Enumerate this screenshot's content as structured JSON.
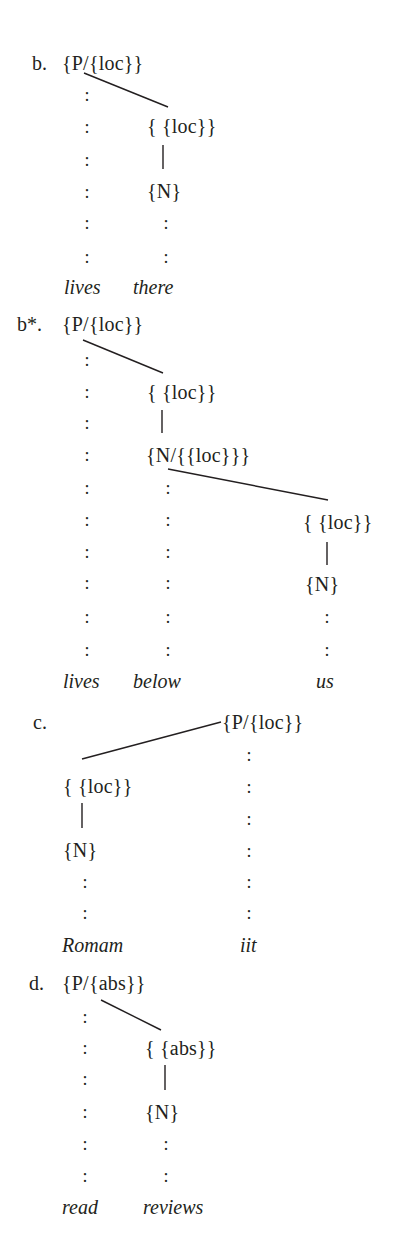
{
  "diagram": {
    "type": "dependency-graph",
    "colors": {
      "ink": "#231f20",
      "background": "#ffffff"
    },
    "examples": [
      {
        "label": "b.",
        "head": "{P/{loc}}",
        "nodes": [
          "{ {loc}}",
          "{N}"
        ],
        "words": [
          "lives",
          "there"
        ],
        "dependency_edges": [
          {
            "from": "{P/{loc}}",
            "to": "{ {loc}}",
            "style": "solid-diagonal"
          },
          {
            "from": "{ {loc}}",
            "to": "{N}",
            "style": "solid-vertical"
          }
        ]
      },
      {
        "label": "b*.",
        "head": "{P/{loc}}",
        "nodes": [
          "{ {loc}}",
          "{N/{{loc}}}",
          "{ {loc}}",
          "{N}"
        ],
        "words": [
          "lives",
          "below",
          "us"
        ],
        "dependency_edges": [
          {
            "from": "{P/{loc}}",
            "to": "{ {loc}}",
            "style": "solid-diagonal"
          },
          {
            "from": "{ {loc}}",
            "to": "{N/{{loc}}}",
            "style": "solid-vertical"
          },
          {
            "from": "{N/{{loc}}}",
            "to": "{ {loc}}",
            "style": "solid-diagonal"
          },
          {
            "from": "{ {loc}}",
            "to": "{N}",
            "style": "solid-vertical"
          }
        ]
      },
      {
        "label": "c.",
        "head": "{P/{loc}}",
        "nodes": [
          "{ {loc}}",
          "{N}"
        ],
        "words": [
          "Romam",
          "iit"
        ],
        "dependency_edges": [
          {
            "from": "{P/{loc}}",
            "to": "{ {loc}}",
            "style": "solid-diagonal"
          },
          {
            "from": "{ {loc}}",
            "to": "{N}",
            "style": "solid-vertical"
          }
        ]
      },
      {
        "label": "d.",
        "head": "{P/{abs}}",
        "nodes": [
          "{ {abs}}",
          "{N}"
        ],
        "words": [
          "read",
          "reviews"
        ],
        "dependency_edges": [
          {
            "from": "{P/{abs}}",
            "to": "{ {abs}}",
            "style": "solid-diagonal"
          },
          {
            "from": "{ {abs}}",
            "to": "{N}",
            "style": "solid-vertical"
          }
        ]
      }
    ],
    "association_line_glyph": ":"
  }
}
